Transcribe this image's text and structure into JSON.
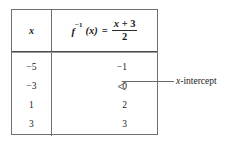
{
  "figure": {
    "name": "inverse-function-table",
    "background_color": "#ffffff",
    "ink_color": "#1a1a1a",
    "rule_color": "#6f6f70"
  },
  "table": {
    "headers": {
      "x_column": "x",
      "y_column": {
        "function_name": "f",
        "superscript": "−1",
        "argument": "(x)",
        "equals": "=",
        "numerator": "x + 3",
        "denominator": "2",
        "full_text": "f⁻¹(x) = (x + 3)/2"
      }
    },
    "rows": [
      {
        "x": "−5",
        "y": "−1"
      },
      {
        "x": "−3",
        "y": "0"
      },
      {
        "x": "1",
        "y": "2"
      },
      {
        "x": "3",
        "y": "3"
      }
    ]
  },
  "annotation": {
    "label_italic": "x",
    "label_rest": "-intercept",
    "label_full": "x-intercept",
    "points_to_row_index": 1,
    "points_to_value": "0",
    "arrow_direction": "left"
  }
}
